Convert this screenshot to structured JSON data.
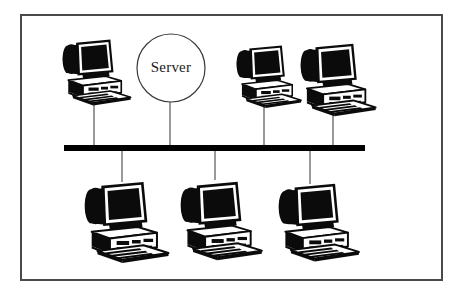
{
  "figure": {
    "kind": "network-topology-diagram",
    "topology": "bus",
    "background_color": "#ffffff",
    "ink_color": "#000000",
    "frame": {
      "name": "figure-border",
      "x": 20,
      "y": 14,
      "width": 423,
      "height": 267,
      "stroke_color": "#4a4a4a",
      "stroke_width": 2
    }
  },
  "bus": {
    "label": "network-bus",
    "x1": 64,
    "x2": 365,
    "y": 148,
    "thickness": 6,
    "color": "#000000"
  },
  "server": {
    "label": "Server",
    "shape": "circle",
    "cx": 171,
    "cy": 68,
    "r": 34,
    "stroke_color": "#3a3a3a",
    "stroke_width": 1.2,
    "fill": "#ffffff",
    "drop_x": 170,
    "drop_y_top": 102,
    "drop_y_bottom": 148
  },
  "link_color": "#555555",
  "link_width": 1.2,
  "nodes": [
    {
      "id": "ws-top-1",
      "name": "workstation-top-left",
      "icon": "desktop-computer-icon",
      "x": 62,
      "y": 38,
      "scale": 0.78,
      "drop_x": 94,
      "drop_from_y": 98,
      "drop_to_y": 148
    },
    {
      "id": "ws-top-2",
      "name": "workstation-top-center-right",
      "icon": "desktop-computer-icon",
      "x": 236,
      "y": 44,
      "scale": 0.74,
      "drop_x": 264,
      "drop_from_y": 101,
      "drop_to_y": 148
    },
    {
      "id": "ws-top-3",
      "name": "workstation-top-right",
      "icon": "desktop-computer-icon",
      "x": 300,
      "y": 42,
      "scale": 0.86,
      "drop_x": 333,
      "drop_from_y": 108,
      "drop_to_y": 148
    },
    {
      "id": "ws-bot-1",
      "name": "workstation-bottom-left",
      "icon": "desktop-computer-icon",
      "x": 84,
      "y": 180,
      "scale": 0.96,
      "drop_x": 122,
      "drop_from_y": 148,
      "drop_to_y": 182
    },
    {
      "id": "ws-bot-2",
      "name": "workstation-bottom-center",
      "icon": "desktop-computer-icon",
      "x": 180,
      "y": 180,
      "scale": 0.93,
      "drop_x": 215,
      "drop_from_y": 148,
      "drop_to_y": 180
    },
    {
      "id": "ws-bot-3",
      "name": "workstation-bottom-right",
      "icon": "desktop-computer-icon",
      "x": 278,
      "y": 182,
      "scale": 0.92,
      "drop_x": 310,
      "drop_from_y": 148,
      "drop_to_y": 184
    }
  ]
}
